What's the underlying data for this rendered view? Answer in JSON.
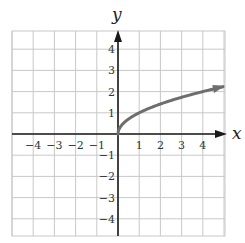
{
  "chart_data": {
    "type": "line",
    "title": "",
    "function": "y = sqrt(x)",
    "xlabel": "x",
    "ylabel": "y",
    "xlim": [
      -5,
      5
    ],
    "ylim": [
      -5,
      4.6
    ],
    "grid": true,
    "legend": null,
    "x_ticks": [
      "-4",
      "-3",
      "-2",
      "-1",
      "1",
      "2",
      "3",
      "4"
    ],
    "y_ticks": [
      "4",
      "3",
      "2",
      "1",
      "-1",
      "-2",
      "-3",
      "-4"
    ],
    "series": [
      {
        "name": "y = √x",
        "x": [
          0,
          0.25,
          1,
          2,
          3,
          4,
          5
        ],
        "y": [
          0,
          0.5,
          1,
          1.41,
          1.73,
          2,
          2.24
        ],
        "color": "#6e6e6e",
        "endpoint": "arrow at right"
      }
    ]
  },
  "labels": {
    "x_axis": "x",
    "y_axis": "y",
    "x_tick_values": [
      "−4",
      "−3",
      "−2",
      "−1",
      "1",
      "2",
      "3",
      "4"
    ],
    "y_tick_values": [
      "4",
      "3",
      "2",
      "1",
      "−1",
      "−2",
      "−3",
      "−4"
    ]
  },
  "colors": {
    "grid": "#c8c8c8",
    "axis": "#1a1a1a",
    "curve": "#6e6e6e"
  }
}
